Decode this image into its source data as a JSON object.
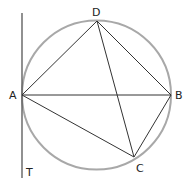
{
  "diagram": {
    "colors": {
      "circle": "#a8a8a8",
      "lines": "#333333",
      "tangent": "#555555",
      "labels": "#222222"
    },
    "circle": {
      "cx": 96.5,
      "cy": 95,
      "r": 74.5
    },
    "points": {
      "A": {
        "label": "A",
        "x": 22,
        "y": 95
      },
      "B": {
        "label": "B",
        "x": 171,
        "y": 95
      },
      "C": {
        "label": "C",
        "x": 134,
        "y": 157
      },
      "D": {
        "label": "D",
        "x": 97,
        "y": 21
      },
      "T": {
        "label": "T",
        "x": 22,
        "y": 178
      }
    },
    "tangent": {
      "label": "tangent line at A",
      "x": 22,
      "y1": 13,
      "y2": 178
    },
    "segments": [
      "AD",
      "AB",
      "AC",
      "DC",
      "DB",
      "BC"
    ]
  }
}
